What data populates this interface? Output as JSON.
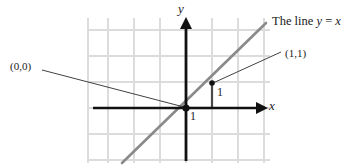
{
  "figure": {
    "kind": "coordinate-plane-diagram",
    "width": 352,
    "height": 167,
    "background_color": "#ffffff"
  },
  "axes": {
    "x_label": "x",
    "y_label": "y",
    "axis_color": "#111111",
    "origin_px": [
      186,
      108
    ],
    "unit_px": 26,
    "x_axis_from_px": [
      93,
      108
    ],
    "x_axis_to_px": [
      264,
      108
    ],
    "y_axis_from_px": [
      186,
      160
    ],
    "y_axis_to_px": [
      186,
      21
    ]
  },
  "grid": {
    "visible": true,
    "color": "#dcdcdc",
    "spacing_px": 26,
    "left_px": 88,
    "right_px": 270,
    "top_px": 18,
    "bottom_px": 163
  },
  "line": {
    "caption": "The line y = x",
    "caption_prefix": "The line ",
    "caption_var_y": "y",
    "caption_equals": " = ",
    "caption_var_x": "x",
    "equation": "y = x",
    "color": "#8a8a8a",
    "from_px": [
      122,
      163
    ],
    "to_px": [
      266,
      23
    ]
  },
  "points": [
    {
      "label": "(0,0)",
      "name": "origin-point",
      "coords": [
        0,
        0
      ],
      "at_px": [
        186,
        108
      ],
      "label_at_px": [
        10,
        61
      ],
      "leader_from_px": [
        42,
        70
      ],
      "leader_to_px": [
        184,
        107
      ],
      "marker": true
    },
    {
      "label": "(1,1)",
      "name": "unit-point",
      "coords": [
        1,
        1
      ],
      "at_px": [
        212,
        83
      ],
      "label_at_px": [
        285,
        48
      ],
      "leader_from_px": [
        281,
        52
      ],
      "leader_to_px": [
        213,
        83
      ],
      "marker": true
    }
  ],
  "measures": [
    {
      "name": "horizontal-unit",
      "label": "1",
      "segment_from_px": [
        186,
        108
      ],
      "segment_to_px": [
        212,
        108
      ],
      "label_at_px": [
        190,
        110
      ],
      "color": "#9a9a9a"
    },
    {
      "name": "vertical-unit",
      "label": "1",
      "segment_from_px": [
        212,
        108
      ],
      "segment_to_px": [
        212,
        83
      ],
      "label_at_px": [
        217,
        86
      ],
      "color": "#6b6b6b"
    }
  ],
  "colors": {
    "ink": "#1a1a1a",
    "grid": "#dcdcdc",
    "line_yx": "#8a8a8a",
    "leader": "#2b2b2b"
  }
}
